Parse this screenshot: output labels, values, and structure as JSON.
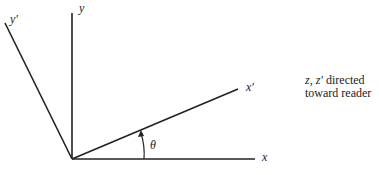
{
  "diagram": {
    "type": "rotated-coordinate-axes",
    "axes": {
      "x": "x",
      "y": "y",
      "x_prime": "x′",
      "y_prime": "y′"
    },
    "angle_label": "θ",
    "note": {
      "vars": "z, z′",
      "line1_rest": " directed",
      "line2": "toward reader"
    },
    "colors": {
      "line": "#222222",
      "background": "#ffffff"
    }
  }
}
